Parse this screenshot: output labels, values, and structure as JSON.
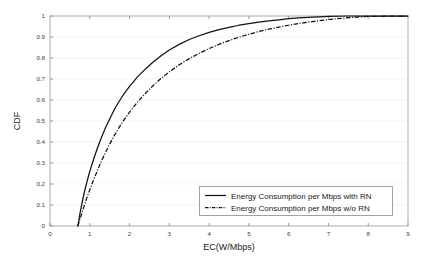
{
  "chart_data": {
    "type": "line",
    "title": "",
    "subtitle": "",
    "xlabel": "EC(W/Mbps)",
    "ylabel": "CDF",
    "xlim": [
      0,
      9
    ],
    "ylim": [
      0,
      1
    ],
    "xticks": [
      "0",
      "1",
      "2",
      "3",
      "4",
      "5",
      "6",
      "7",
      "8",
      "9"
    ],
    "yticks": [
      "0",
      "0.1",
      "0.2",
      "0.3",
      "0.4",
      "0.5",
      "0.6",
      "0.7",
      "0.8",
      "0.9",
      "1"
    ],
    "grid": "horizontal",
    "legend_position": "lower-right",
    "series": [
      {
        "name": "Energy Consumption per Mbps with RN",
        "style": "solid",
        "color": "#111111",
        "x": [
          0.7,
          0.72,
          0.75,
          0.8,
          0.85,
          0.9,
          0.95,
          1.0,
          1.1,
          1.2,
          1.3,
          1.4,
          1.5,
          1.6,
          1.7,
          1.8,
          1.9,
          2.0,
          2.2,
          2.4,
          2.6,
          2.8,
          3.0,
          3.25,
          3.5,
          3.75,
          4.0,
          4.25,
          4.5,
          4.75,
          5.0,
          5.25,
          5.5,
          5.75,
          6.0,
          6.25,
          6.5,
          7.0,
          7.5,
          8.0,
          9.0
        ],
        "y": [
          0.0,
          0.02,
          0.055,
          0.105,
          0.15,
          0.19,
          0.225,
          0.26,
          0.32,
          0.375,
          0.425,
          0.47,
          0.51,
          0.548,
          0.582,
          0.612,
          0.64,
          0.665,
          0.71,
          0.748,
          0.782,
          0.812,
          0.838,
          0.865,
          0.888,
          0.906,
          0.922,
          0.935,
          0.946,
          0.956,
          0.964,
          0.971,
          0.977,
          0.982,
          0.987,
          0.991,
          0.994,
          0.998,
          1.0,
          1.0,
          1.0
        ]
      },
      {
        "name": "Energy Consumption per Mbps w/o RN",
        "style": "dash-dot",
        "color": "#111111",
        "x": [
          0.7,
          0.73,
          0.78,
          0.84,
          0.9,
          0.96,
          1.02,
          1.1,
          1.2,
          1.3,
          1.4,
          1.5,
          1.6,
          1.7,
          1.8,
          1.9,
          2.0,
          2.2,
          2.4,
          2.6,
          2.8,
          3.0,
          3.25,
          3.5,
          3.75,
          4.0,
          4.25,
          4.5,
          4.75,
          5.0,
          5.25,
          5.5,
          5.75,
          6.0,
          6.25,
          6.5,
          7.0,
          7.5,
          8.0,
          9.0
        ],
        "y": [
          0.0,
          0.018,
          0.048,
          0.085,
          0.12,
          0.152,
          0.182,
          0.222,
          0.268,
          0.312,
          0.352,
          0.39,
          0.425,
          0.458,
          0.488,
          0.516,
          0.542,
          0.59,
          0.632,
          0.67,
          0.704,
          0.734,
          0.768,
          0.797,
          0.822,
          0.845,
          0.865,
          0.883,
          0.899,
          0.913,
          0.926,
          0.937,
          0.947,
          0.956,
          0.964,
          0.971,
          0.983,
          0.992,
          0.998,
          1.0
        ]
      }
    ]
  },
  "legend": {
    "items": [
      {
        "label": "Energy Consumption per Mbps with RN",
        "style": "solid"
      },
      {
        "label": "Energy Consumption per Mbps w/o RN",
        "style": "dash-dot"
      }
    ]
  }
}
